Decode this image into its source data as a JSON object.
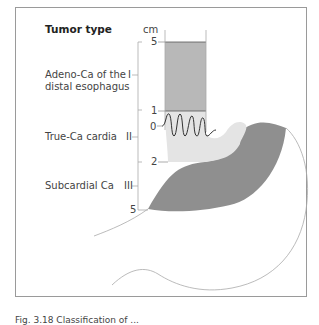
{
  "diagram": {
    "title": "Tumor type",
    "unit_label": "cm",
    "tumor_types": [
      {
        "roman": "I",
        "label_line1": "Adeno-Ca of the",
        "label_line2": "distal esophagus"
      },
      {
        "roman": "II",
        "label_line1": "True-Ca cardia",
        "label_line2": ""
      },
      {
        "roman": "III",
        "label_line1": "Subcardial Ca",
        "label_line2": ""
      }
    ],
    "scale_ticks": [
      "5",
      "1",
      "0",
      "2",
      "5"
    ],
    "colors": {
      "type_I_fill": "#b8b8b8",
      "type_II_fill": "#e4e4e4",
      "type_III_fill": "#8f8f8f",
      "outline": "#9a9a9a",
      "z_line": "#333333"
    }
  },
  "caption": "Fig. 3.18  Classification of ..."
}
